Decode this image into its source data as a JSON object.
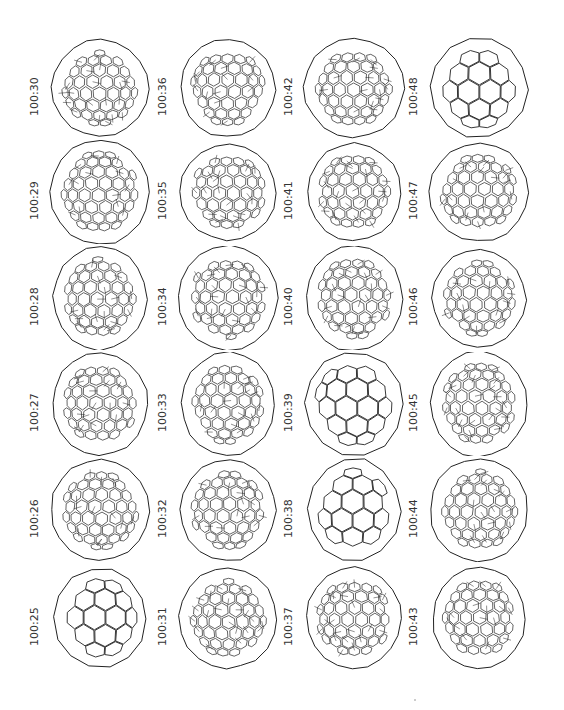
{
  "figure": {
    "line_color": "#222222",
    "background": "#ffffff",
    "columns": [
      {
        "cells": [
          {
            "label": "100:30",
            "density": "dense"
          },
          {
            "label": "100:29",
            "density": "dense"
          },
          {
            "label": "100:28",
            "density": "dense"
          },
          {
            "label": "100:27",
            "density": "dense"
          },
          {
            "label": "100:26",
            "density": "dense"
          },
          {
            "label": "100:25",
            "density": "sparse"
          }
        ]
      },
      {
        "cells": [
          {
            "label": "100:36",
            "density": "dense"
          },
          {
            "label": "100:35",
            "density": "dense"
          },
          {
            "label": "100:34",
            "density": "dense"
          },
          {
            "label": "100:33",
            "density": "dense"
          },
          {
            "label": "100:32",
            "density": "dense"
          },
          {
            "label": "100:31",
            "density": "dense"
          }
        ]
      },
      {
        "cells": [
          {
            "label": "100:42",
            "density": "dense"
          },
          {
            "label": "100:41",
            "density": "dense"
          },
          {
            "label": "100:40",
            "density": "dense"
          },
          {
            "label": "100:39",
            "density": "sparse"
          },
          {
            "label": "100:38",
            "density": "sparse"
          },
          {
            "label": "100:37",
            "density": "dense"
          }
        ]
      },
      {
        "cells": [
          {
            "label": "100:48",
            "density": "sparse"
          },
          {
            "label": "100:47",
            "density": "dense"
          },
          {
            "label": "100:46",
            "density": "dense"
          },
          {
            "label": "100:45",
            "density": "dense"
          },
          {
            "label": "100:44",
            "density": "dense"
          },
          {
            "label": "100:43",
            "density": "dense"
          }
        ]
      }
    ]
  }
}
